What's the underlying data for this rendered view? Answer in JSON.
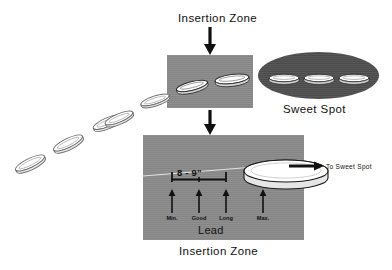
{
  "figure": {
    "title_top": "Insertion Zone",
    "title_bottom": "Insertion Zone",
    "sweet_spot_label": "Sweet Spot",
    "to_sweet_spot_label": "To Sweet Spot",
    "measurement_label": "8 - 9\"",
    "lead_label": "Lead",
    "tick_labels": [
      {
        "id": "min",
        "text": "Min."
      },
      {
        "id": "good",
        "text": "Good"
      },
      {
        "id": "long",
        "text": "Long"
      },
      {
        "id": "max",
        "text": "Max."
      }
    ],
    "colors": {
      "panel_gray": "#8b8b8b",
      "sweet_spot_gray": "#4f4f4f",
      "disc_white": "#ffffff",
      "disc_shade": "#d8d8d8",
      "ink": "#111111",
      "background": "#ffffff"
    },
    "flight_path_discs": 5,
    "insertion_zone_discs": 2,
    "sweet_spot_discs": 3
  }
}
